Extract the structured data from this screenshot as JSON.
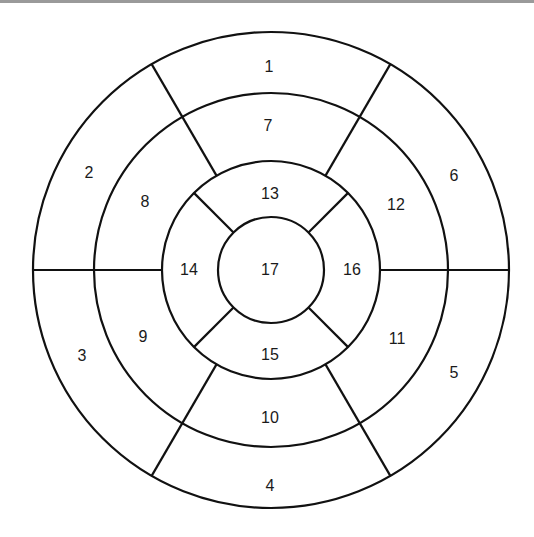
{
  "diagram": {
    "type": "bullseye-17-segment",
    "colors": {
      "stroke": "#111111",
      "background": "#ffffff",
      "label": "#1a1a1a",
      "top_rule": "#9a9a9a"
    },
    "center": {
      "x": 271,
      "y": 270
    },
    "radii": {
      "outer": 238,
      "ring2": 177,
      "ring3": 109,
      "apex": 53
    },
    "segments": [
      {
        "id": "1",
        "label": "1",
        "x": 269,
        "y": 66
      },
      {
        "id": "2",
        "label": "2",
        "x": 89,
        "y": 172
      },
      {
        "id": "3",
        "label": "3",
        "x": 82,
        "y": 355
      },
      {
        "id": "4",
        "label": "4",
        "x": 270,
        "y": 485
      },
      {
        "id": "5",
        "label": "5",
        "x": 454,
        "y": 372
      },
      {
        "id": "6",
        "label": "6",
        "x": 454,
        "y": 175
      },
      {
        "id": "7",
        "label": "7",
        "x": 268,
        "y": 125
      },
      {
        "id": "8",
        "label": "8",
        "x": 145,
        "y": 201
      },
      {
        "id": "9",
        "label": "9",
        "x": 143,
        "y": 336
      },
      {
        "id": "10",
        "label": "10",
        "x": 270,
        "y": 417
      },
      {
        "id": "11",
        "label": "11",
        "x": 397,
        "y": 338
      },
      {
        "id": "12",
        "label": "12",
        "x": 396,
        "y": 204
      },
      {
        "id": "13",
        "label": "13",
        "x": 270,
        "y": 193
      },
      {
        "id": "14",
        "label": "14",
        "x": 189,
        "y": 269
      },
      {
        "id": "15",
        "label": "15",
        "x": 270,
        "y": 354
      },
      {
        "id": "16",
        "label": "16",
        "x": 352,
        "y": 269
      },
      {
        "id": "17",
        "label": "17",
        "x": 270,
        "y": 269
      }
    ]
  }
}
